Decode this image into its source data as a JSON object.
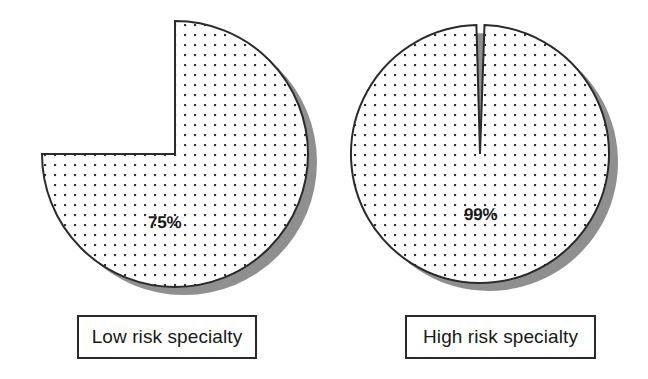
{
  "figure": {
    "background_color": "#ffffff",
    "width": 648,
    "height": 379
  },
  "style": {
    "outline_color": "#2b2b2b",
    "fill_color": "#ffffff",
    "dot_color": "#333333",
    "shadow_color": "#8f8f8f",
    "caption_border_color": "#2a2a2a",
    "caption_text_color": "#181818"
  },
  "charts": [
    {
      "id": "low-risk",
      "percent_label": "75%",
      "caption": "Low risk specialty",
      "center_x": 175,
      "center_y": 154,
      "radius": 133,
      "slice_percent": 75,
      "start_angle_deg": 0,
      "sweep_deg": 270,
      "label_x": 148,
      "label_y": 214,
      "caption_box": {
        "x": 77,
        "y": 315,
        "width": 180,
        "height": 44
      }
    },
    {
      "id": "high-risk",
      "percent_label": "99%",
      "caption": "High risk specialty",
      "center_x": 480,
      "center_y": 154,
      "radius": 129,
      "slice_percent": 99,
      "start_angle_deg": 2,
      "sweep_deg": 356.4,
      "label_x": 464,
      "label_y": 206,
      "caption_box": {
        "x": 405,
        "y": 315,
        "width": 191,
        "height": 44
      }
    }
  ],
  "chart_data": {
    "type": "pie",
    "title": "",
    "subtitle": "",
    "xlabel": "",
    "ylabel": "",
    "legend_position": "below-each-chart",
    "grid": false,
    "note": "Two exploded/cut pie charts, each showing a single highlighted proportion of the whole.",
    "charts": [
      {
        "name": "Low risk specialty",
        "labels": [
          "Low risk specialty",
          "Remainder"
        ],
        "values": [
          75,
          25
        ],
        "value_labels": [
          "75%",
          ""
        ],
        "units": "percent",
        "total": 100
      },
      {
        "name": "High risk specialty",
        "labels": [
          "High risk specialty",
          "Remainder"
        ],
        "values": [
          99,
          1
        ],
        "value_labels": [
          "99%",
          ""
        ],
        "units": "percent",
        "total": 100
      }
    ],
    "categories": [
      "Low risk specialty",
      "High risk specialty"
    ],
    "values": [
      75,
      99
    ]
  }
}
